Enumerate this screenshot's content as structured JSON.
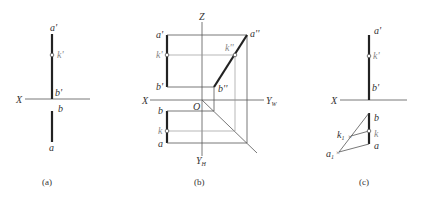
{
  "figure": {
    "panels": [
      {
        "id": "a",
        "caption": "(a)",
        "axis_label": "X",
        "points": {
          "a_prime": "a'",
          "k_prime": "k'",
          "b_prime": "b'",
          "b": "b",
          "a": "a"
        }
      },
      {
        "id": "b",
        "caption": "(b)",
        "axes": {
          "z": "Z",
          "x": "X",
          "yw": "Y",
          "yw_sub": "W",
          "yh": "Y",
          "yh_sub": "H",
          "origin": "O"
        },
        "points": {
          "a_prime": "a'",
          "k_prime": "k'",
          "b_prime": "b'",
          "b": "b",
          "k": "k",
          "a": "a",
          "a_dprime": "a''",
          "k_dprime": "k''",
          "b_dprime": "b''"
        }
      },
      {
        "id": "c",
        "caption": "(c)",
        "axis_label": "X",
        "points": {
          "a_prime": "a'",
          "k_prime": "k'",
          "b_prime": "b'",
          "b": "b",
          "k": "k",
          "a": "a",
          "k1": "k",
          "k1_sub": "1",
          "a1": "a",
          "a1_sub": "1"
        }
      }
    ],
    "colors": {
      "line": "#222222",
      "axis": "#555555",
      "projector": "#999999",
      "background": "#ffffff"
    }
  }
}
